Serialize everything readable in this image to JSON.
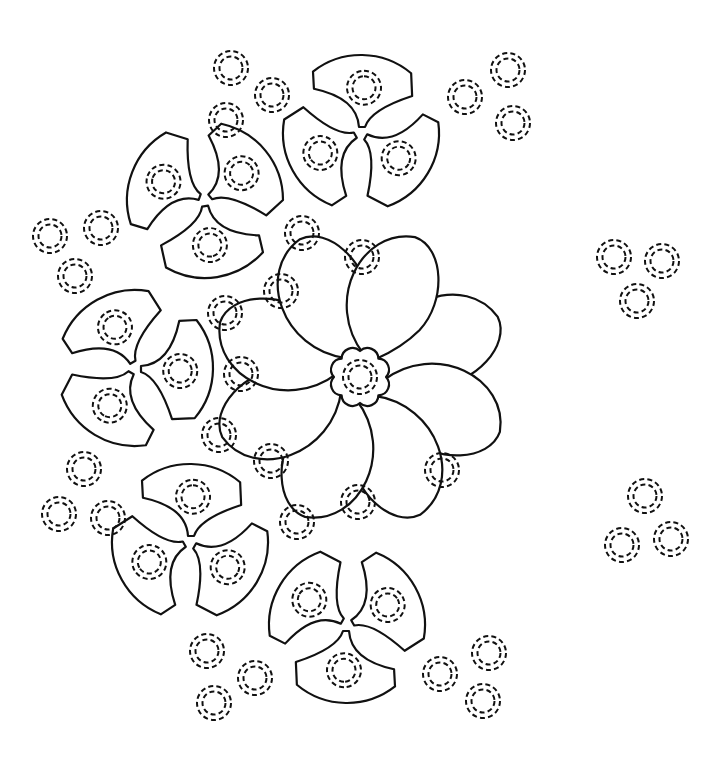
{
  "canvas": {
    "width": 719,
    "height": 759,
    "background": "#ffffff",
    "line_color": "#111111"
  },
  "stud": {
    "outer_radius": 17,
    "inner_radius": 11.5,
    "style": "dashed-double-ring"
  },
  "flower": {
    "name": "central-eight-petal-flower",
    "center": [
      360,
      377
    ],
    "petal_count": 8,
    "petal_length": 150,
    "petal_width": 62,
    "rotation_deg": -20,
    "center_scallop_radius": 26,
    "studs_on_petals": [
      [
        362,
        257
      ],
      [
        281,
        291
      ],
      [
        241,
        374
      ],
      [
        271,
        461
      ],
      [
        358,
        502
      ],
      [
        442,
        470
      ]
    ]
  },
  "triskelions": [
    {
      "name": "triskelion-top",
      "center": [
        361,
        133
      ],
      "rotation_deg": -90,
      "radius": 78
    },
    {
      "name": "triskelion-upper-left",
      "center": [
        205,
        200
      ],
      "rotation_deg": 200,
      "radius": 78
    },
    {
      "name": "triskelion-left",
      "center": [
        135,
        368
      ],
      "rotation_deg": 0,
      "radius": 78
    },
    {
      "name": "triskelion-lower-left",
      "center": [
        190,
        542
      ],
      "rotation_deg": -90,
      "radius": 78
    },
    {
      "name": "triskelion-bottom",
      "center": [
        347,
        625
      ],
      "rotation_deg": 90,
      "radius": 78
    }
  ],
  "loose_studs": [
    [
      231,
      68
    ],
    [
      272,
      95
    ],
    [
      226,
      120
    ],
    [
      508,
      70
    ],
    [
      465,
      97
    ],
    [
      513,
      123
    ],
    [
      50,
      236
    ],
    [
      101,
      228
    ],
    [
      75,
      276
    ],
    [
      614,
      257
    ],
    [
      662,
      261
    ],
    [
      637,
      301
    ],
    [
      645,
      496
    ],
    [
      622,
      545
    ],
    [
      671,
      539
    ],
    [
      84,
      469
    ],
    [
      59,
      514
    ],
    [
      108,
      518
    ],
    [
      207,
      651
    ],
    [
      255,
      678
    ],
    [
      214,
      703
    ],
    [
      440,
      674
    ],
    [
      489,
      653
    ],
    [
      483,
      701
    ],
    [
      302,
      233
    ],
    [
      225,
      313
    ],
    [
      219,
      435
    ],
    [
      297,
      522
    ]
  ]
}
